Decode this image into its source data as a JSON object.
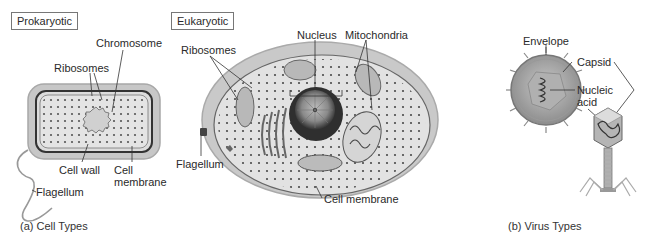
{
  "prokaryotic": {
    "title": "Prokaryotic",
    "labels": {
      "chromosome": "Chromosome",
      "ribosomes": "Ribosomes",
      "cell_wall": "Cell wall",
      "cell_membrane_1": "Cell",
      "cell_membrane_2": "membrane",
      "flagellum": "Flagellum"
    }
  },
  "eukaryotic": {
    "title": "Eukaryotic",
    "labels": {
      "ribosomes": "Ribosomes",
      "nucleus": "Nucleus",
      "mitochondria": "Mitochondria",
      "flagellum": "Flagellum",
      "cell_membrane": "Cell membrane"
    }
  },
  "virus": {
    "labels": {
      "envelope": "Envelope",
      "capsid": "Capsid",
      "nucleic_1": "Nucleic",
      "nucleic_2": "acid"
    }
  },
  "captions": {
    "a": "(a) Cell Types",
    "b": "(b) Virus Types"
  }
}
